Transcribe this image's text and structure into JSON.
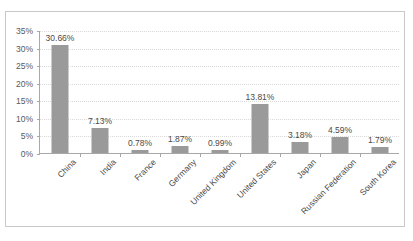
{
  "chart_data": {
    "type": "bar",
    "title": "",
    "xlabel": "",
    "ylabel": "",
    "ylim": [
      0,
      35
    ],
    "grid": true,
    "legend": "none",
    "y_ticks": [
      "0%",
      "5%",
      "10%",
      "15%",
      "20%",
      "25%",
      "30%",
      "35%"
    ],
    "y_tick_values": [
      0,
      5,
      10,
      15,
      20,
      25,
      30,
      35
    ],
    "categories": [
      "China",
      "India",
      "France",
      "Germany",
      "United Kingdom",
      "United States",
      "Japan",
      "Russian Federation",
      "South Korea"
    ],
    "values": [
      30.66,
      7.13,
      0.78,
      1.87,
      0.99,
      13.81,
      3.18,
      4.59,
      1.79
    ],
    "data_labels": [
      "30.66%",
      "7.13%",
      "0.78%",
      "1.87%",
      "0.99%",
      "13.81%",
      "3.18%",
      "4.59%",
      "1.79%"
    ],
    "bar_color": "#9a9a9a",
    "grid_color": "#d9d9d9",
    "axis_color": "#a8a8a8",
    "background_color": "#ffffff",
    "border_color": "#c9c9c9",
    "text_color": "#4a4a4a"
  }
}
